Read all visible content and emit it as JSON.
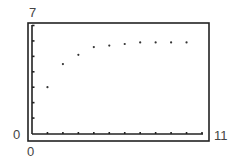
{
  "chart_data": {
    "type": "scatter",
    "title": "",
    "xlabel": "",
    "ylabel": "",
    "xlim": [
      0,
      11
    ],
    "ylim": [
      0,
      7
    ],
    "grid": false,
    "legend": null,
    "x_tick_labels": [
      "0",
      "11"
    ],
    "y_tick_labels": [
      "0",
      "7"
    ],
    "x_ticks": [
      0,
      1,
      2,
      3,
      4,
      5,
      6,
      7,
      8,
      9,
      10,
      11
    ],
    "y_ticks": [
      0,
      1,
      2,
      3,
      4,
      5,
      6,
      7
    ],
    "series": [
      {
        "name": "points",
        "x": [
          1,
          2,
          3,
          4,
          5,
          6,
          7,
          8,
          9,
          10
        ],
        "y": [
          3.0,
          4.5,
          5.1,
          5.6,
          5.7,
          5.8,
          5.9,
          5.9,
          5.9,
          5.9
        ]
      }
    ]
  },
  "labels": {
    "ymax": "7",
    "ymin": "0",
    "xmin": "0",
    "xmax": "11"
  },
  "colors": {
    "axis": "#222222",
    "point": "#333333",
    "text": "#444444"
  }
}
